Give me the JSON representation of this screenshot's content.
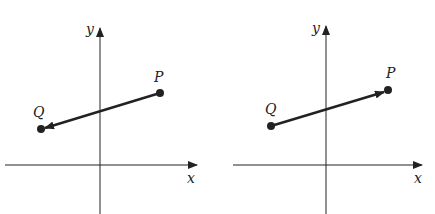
{
  "panels": [
    {
      "name": "left",
      "axis_labels": {
        "x": "x",
        "y": "y"
      },
      "points": {
        "P": "P",
        "Q": "Q"
      },
      "vector": "P to Q"
    },
    {
      "name": "right",
      "axis_labels": {
        "x": "x",
        "y": "y"
      },
      "points": {
        "P": "P",
        "Q": "Q"
      },
      "vector": "Q to P"
    }
  ],
  "colors": {
    "ink": "#222222",
    "background": "#ffffff"
  }
}
